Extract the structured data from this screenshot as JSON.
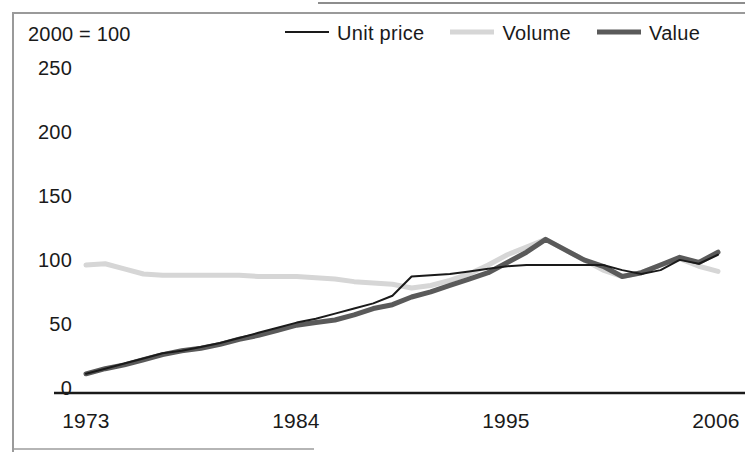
{
  "figure": {
    "note": "2000 = 100",
    "axis_color": "#1a1a1a",
    "frame_color": "#9a9a9a"
  },
  "legend": {
    "position": "top",
    "items": [
      {
        "label": "Unit price",
        "color": "#1a1a1a",
        "width": 2
      },
      {
        "label": "Volume",
        "color": "#d6d6d6",
        "width": 5
      },
      {
        "label": "Value",
        "color": "#5a5a5a",
        "width": 5
      }
    ]
  },
  "chart_data": {
    "type": "line",
    "title": "",
    "subtitle": "",
    "xlabel": "",
    "ylabel": "",
    "note": "2000 = 100",
    "grid": false,
    "legend_position": "top",
    "xlim": [
      1973,
      2006
    ],
    "ylim": [
      0,
      250
    ],
    "ytick_labels": [
      "0",
      "50",
      "100",
      "150",
      "200",
      "250"
    ],
    "yticks": [
      0,
      50,
      100,
      150,
      200,
      250
    ],
    "xtick_labels": [
      "1973",
      "1984",
      "1995",
      "2006"
    ],
    "xticks": [
      1973,
      1984,
      1995,
      2006
    ],
    "x": [
      1973,
      1974,
      1975,
      1976,
      1977,
      1978,
      1979,
      1980,
      1981,
      1982,
      1983,
      1984,
      1985,
      1986,
      1987,
      1988,
      1989,
      1990,
      1991,
      1992,
      1993,
      1994,
      1995,
      1996,
      1997,
      1998,
      1999,
      2000,
      2001,
      2002,
      2003,
      2004,
      2005,
      2006
    ],
    "series": [
      {
        "name": "Unit price",
        "color": "#1a1a1a",
        "values": [
          15,
          19,
          23,
          27,
          31,
          33,
          36,
          39,
          43,
          47,
          51,
          55,
          58,
          62,
          66,
          70,
          76,
          91,
          92,
          93,
          95,
          97,
          99,
          100,
          100,
          100,
          100,
          100,
          96,
          93,
          96,
          104,
          101,
          108
        ]
      },
      {
        "name": "Volume",
        "color": "#d6d6d6",
        "values": [
          100,
          101,
          97,
          93,
          92,
          92,
          92,
          92,
          92,
          91,
          91,
          91,
          90,
          89,
          87,
          86,
          85,
          82,
          84,
          88,
          93,
          100,
          108,
          114,
          120,
          112,
          104,
          96,
          91,
          94,
          100,
          105,
          99,
          95
        ]
      },
      {
        "name": "Value",
        "color": "#5a5a5a",
        "values": [
          15,
          19,
          22,
          26,
          30,
          33,
          35,
          38,
          42,
          45,
          49,
          53,
          55,
          57,
          61,
          66,
          69,
          75,
          79,
          84,
          89,
          94,
          102,
          110,
          120,
          112,
          104,
          99,
          91,
          94,
          100,
          106,
          102,
          110
        ]
      }
    ]
  }
}
